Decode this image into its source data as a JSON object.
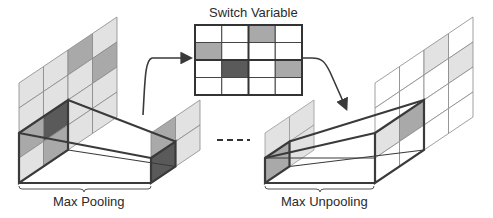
{
  "labels": {
    "switch_title": "Switch Variable",
    "max_pooling": "Max Pooling",
    "max_unpooling": "Max Unpooling"
  },
  "colors": {
    "white": "#ffffff",
    "light": "#e2e2e2",
    "mid": "#a9a9a9",
    "dark": "#5a5a5a",
    "line": "#3a3a3a",
    "grid_line": "#777777"
  },
  "input_grid": [
    [
      "light",
      "light",
      "mid",
      "light"
    ],
    [
      "light",
      "light",
      "light",
      "mid"
    ],
    [
      "mid",
      "dark",
      "light",
      "light"
    ],
    [
      "light",
      "mid",
      "light",
      "light"
    ]
  ],
  "switch_grid": [
    [
      "white",
      "white",
      "mid",
      "white"
    ],
    [
      "mid",
      "white",
      "white",
      "white"
    ],
    [
      "white",
      "dark",
      "white",
      "mid"
    ],
    [
      "white",
      "white",
      "white",
      "white"
    ]
  ],
  "pooled_grid": [
    [
      "mid",
      "light"
    ],
    [
      "dark",
      "light"
    ]
  ],
  "unpool_input_grid": [
    [
      "light",
      "light"
    ],
    [
      "mid",
      "light"
    ]
  ],
  "output_grid": [
    [
      "white",
      "white",
      "light",
      "white"
    ],
    [
      "white",
      "white",
      "white",
      "light"
    ],
    [
      "light",
      "mid",
      "white",
      "white"
    ],
    [
      "white",
      "white",
      "white",
      "white"
    ]
  ]
}
